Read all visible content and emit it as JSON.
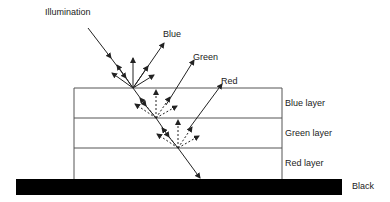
{
  "diagram": {
    "labels": {
      "illumination": "Illumination",
      "blue": "Blue",
      "green": "Green",
      "red": "Red",
      "blue_layer": "Blue layer",
      "green_layer": "Green layer",
      "red_layer": "Red layer",
      "black": "Black"
    },
    "layers": [
      "Blue layer",
      "Green layer",
      "Red layer"
    ],
    "base": "Black",
    "colors": {
      "ink": "#222222",
      "base": "#000000",
      "line": "#555555"
    }
  }
}
